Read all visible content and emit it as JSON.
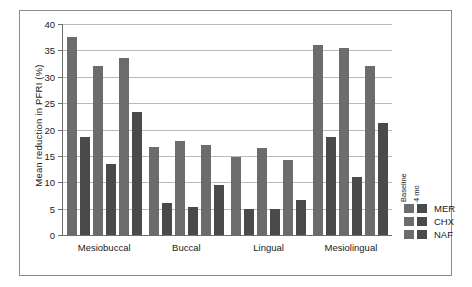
{
  "chart_data": {
    "type": "bar",
    "title": "",
    "xlabel": "",
    "ylabel": "Mean reduction in PFRI (%)",
    "ylim": [
      0,
      40
    ],
    "ytick_labels": [
      "0",
      "5",
      "10",
      "15",
      "20",
      "25",
      "30",
      "35",
      "40"
    ],
    "ytick_values": [
      0,
      5,
      10,
      15,
      20,
      25,
      30,
      35,
      40
    ],
    "grid": true,
    "categories": [
      "Mesiobuccal",
      "Buccal",
      "Lingual",
      "Mesiolingual"
    ],
    "series": [
      {
        "name": "MER Baseline",
        "group": "MER",
        "time": "Baseline",
        "color": "#6c6c6c",
        "values": [
          37.5,
          16.7,
          14.7,
          36.0
        ]
      },
      {
        "name": "MER 4 mo",
        "group": "MER",
        "time": "4 mo",
        "color": "#4a4a4a",
        "values": [
          18.6,
          6.1,
          5.0,
          18.6
        ]
      },
      {
        "name": "CHX Baseline",
        "group": "CHX",
        "time": "Baseline",
        "color": "#6c6c6c",
        "values": [
          32.0,
          17.9,
          16.5,
          35.5
        ]
      },
      {
        "name": "CHX 4 mo",
        "group": "CHX",
        "time": "4 mo",
        "color": "#4a4a4a",
        "values": [
          13.4,
          5.4,
          4.9,
          11.0
        ]
      },
      {
        "name": "NAF Baseline",
        "group": "NAF",
        "time": "Baseline",
        "color": "#6c6c6c",
        "values": [
          33.5,
          17.0,
          14.2,
          32.0
        ]
      },
      {
        "name": "NAF 4 mo",
        "group": "NAF",
        "time": "4 mo",
        "color": "#4a4a4a",
        "values": [
          23.3,
          9.5,
          6.7,
          21.2
        ]
      }
    ],
    "legend": {
      "position": "right",
      "column_headers": [
        "Baseline",
        "4 mo"
      ],
      "rows": [
        "MER",
        "CHX",
        "NAF"
      ],
      "colors": {
        "baseline": "#6c6c6c",
        "four_mo": "#4a4a4a"
      }
    }
  }
}
